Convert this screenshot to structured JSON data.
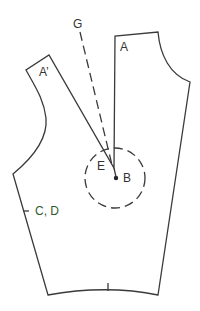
{
  "diagram": {
    "type": "sewing-pattern-bodice-dart-manipulation",
    "labels": {
      "G": "G",
      "A": "A",
      "A_prime": "A’",
      "E": "E",
      "B": "B",
      "CD": "C, D"
    },
    "colors": {
      "line": "#3a3a3a",
      "text": "#333333",
      "cd_label": "#2f5a2a"
    }
  }
}
